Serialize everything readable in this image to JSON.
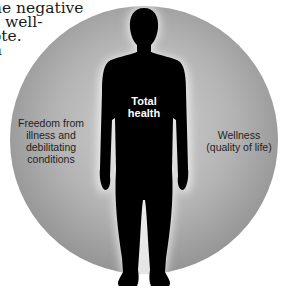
{
  "page_text": {
    "lines": [
      "he negative",
      "s well-",
      "ote.",
      "n"
    ]
  },
  "figure": {
    "center_label": [
      "Total",
      "health"
    ],
    "left_label": [
      "Freedom from",
      "illness and",
      "debilitating",
      "conditions"
    ],
    "right_label": [
      "Wellness",
      "(quality of life)"
    ],
    "colors": {
      "circle_light": "#c9c9c9",
      "circle_mid": "#a8a8a8",
      "circle_dark": "#8a8a8a",
      "silhouette": "#000000",
      "glow": "#f2f2f2"
    }
  }
}
